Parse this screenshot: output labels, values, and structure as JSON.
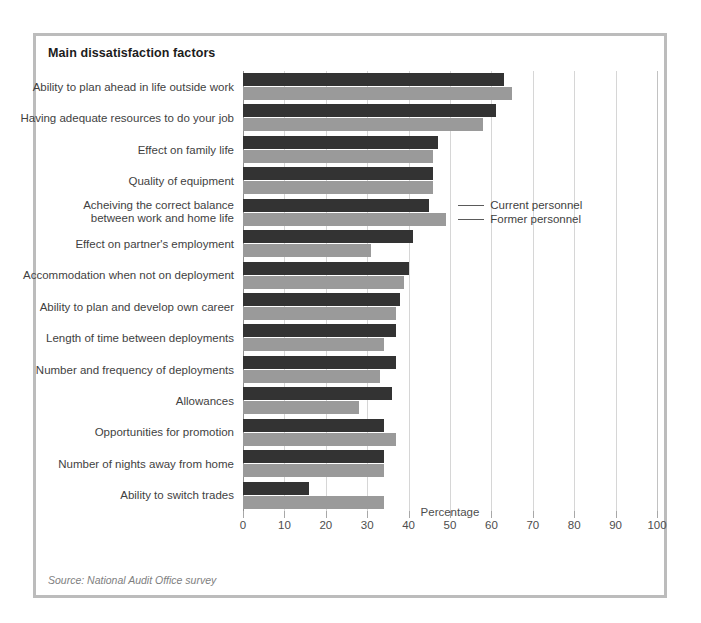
{
  "figure": {
    "title": "Main dissatisfaction factors",
    "source": "Source: National Audit Office survey"
  },
  "legend": {
    "current_label": "Current personnel",
    "former_label": "Former personnel"
  },
  "colors": {
    "current": "#333333",
    "former": "#9a9a9a",
    "frame": "#bcbcbc",
    "grid": "#d6d6d6"
  },
  "chart_data": {
    "type": "bar",
    "orientation": "horizontal",
    "title": "Main dissatisfaction factors",
    "xlabel": "Percentage",
    "ylabel": "",
    "xlim": [
      0,
      100
    ],
    "xticks": [
      0,
      10,
      20,
      30,
      40,
      50,
      60,
      70,
      80,
      90,
      100
    ],
    "grid": true,
    "legend_position": "inside-right",
    "categories": [
      "Ability to plan ahead in life outside work",
      "Having adequate resources to do your job",
      "Effect on family life",
      "Quality of equipment",
      "Acheiving the correct balance\nbetween work and home life",
      "Effect on partner's employment",
      "Accommodation when not on deployment",
      "Ability to plan and develop own career",
      "Length of time between deployments",
      "Number and frequency of deployments",
      "Allowances",
      "Opportunities for promotion",
      "Number of nights away from home",
      "Ability to switch trades"
    ],
    "series": [
      {
        "name": "Current personnel",
        "color": "#333333",
        "values": [
          63,
          61,
          47,
          46,
          45,
          41,
          40,
          38,
          37,
          37,
          36,
          34,
          34,
          16
        ]
      },
      {
        "name": "Former personnel",
        "color": "#9a9a9a",
        "values": [
          65,
          58,
          46,
          46,
          49,
          31,
          39,
          37,
          34,
          33,
          28,
          37,
          34,
          34
        ]
      }
    ],
    "annotations": [
      {
        "text": "Current personnel",
        "points_to": "Acheiving the correct balance between work and home life - Current personnel bar"
      },
      {
        "text": "Former personnel",
        "points_to": "Acheiving the correct balance between work and home life - Former personnel bar"
      }
    ],
    "source": "Source: National Audit Office survey"
  }
}
